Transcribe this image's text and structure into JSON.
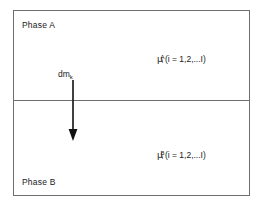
{
  "figure": {
    "name": "two-phase-equilibrium-diagram",
    "background_color": "#ffffff",
    "border_color": "#6e6e6e",
    "text_color": "#1a1a1a"
  },
  "regions": {
    "upper": {
      "label": "Phase A",
      "potential": {
        "symbol": "μ",
        "subscript": "i",
        "superscript": "A",
        "args": "(i = 1,2,...I)"
      }
    },
    "lower": {
      "label": "Phase B",
      "potential": {
        "symbol": "μ",
        "subscript": "i",
        "superscript": "B",
        "args": "(i = 1,2,...I)"
      }
    }
  },
  "arrow": {
    "icon": "arrow-down-icon",
    "label_base": "dm",
    "label_subscript": "k",
    "direction": "down",
    "color": "#111111"
  }
}
